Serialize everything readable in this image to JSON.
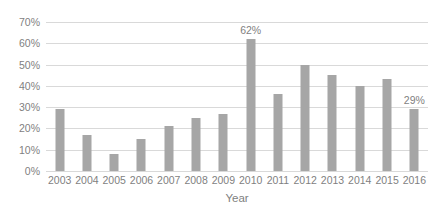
{
  "chart_data": {
    "type": "bar",
    "title": "",
    "subtitle": "",
    "xlabel": "Year",
    "ylabel": "",
    "categories": [
      "2003",
      "2004",
      "2005",
      "2006",
      "2007",
      "2008",
      "2009",
      "2010",
      "2011",
      "2012",
      "2013",
      "2014",
      "2015",
      "2016"
    ],
    "values": [
      29,
      17,
      8,
      15,
      21,
      25,
      27,
      62,
      36,
      50,
      45,
      40,
      43,
      29
    ],
    "ylim": [
      0,
      70
    ],
    "ytick_values": [
      0,
      10,
      20,
      30,
      40,
      50,
      60,
      70
    ],
    "ytick_labels": [
      "0%",
      "10%",
      "20%",
      "30%",
      "40%",
      "50%",
      "60%",
      "70%"
    ],
    "grid": true,
    "legend": false,
    "legend_position": "none",
    "data_labels": [
      {
        "category": "2010",
        "text": "62%"
      },
      {
        "category": "2016",
        "text": "29%"
      }
    ],
    "series": [
      {
        "name": "",
        "values": [
          29,
          17,
          8,
          15,
          21,
          25,
          27,
          62,
          36,
          50,
          45,
          40,
          43,
          29
        ]
      }
    ],
    "colors": {
      "bar": "#a6a6a6",
      "gridline": "#d9d9d9",
      "text": "#7f7f7f",
      "background": "#ffffff"
    }
  }
}
